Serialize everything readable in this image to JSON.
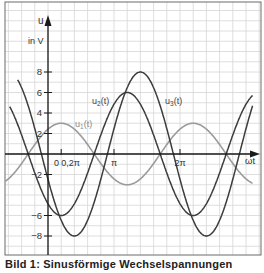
{
  "chart_data": {
    "type": "line",
    "title": "",
    "xlabel": "ωt",
    "ylabel": "u",
    "yunit": "in V",
    "xlim_rad_over_pi": [
      -0.65,
      3.1
    ],
    "ylim": [
      -9.5,
      14
    ],
    "y_ticks": [
      8,
      6,
      4,
      2,
      -2,
      -6,
      -8
    ],
    "y_tick_labels": [
      "8",
      "6",
      "4",
      "2",
      "−2",
      "−6",
      "−8"
    ],
    "x_ticks_over_pi": [
      0.2,
      1,
      2
    ],
    "x_tick_labels": [
      "0,2π",
      "π",
      "2π"
    ],
    "origin_label": "0",
    "grid": true,
    "series": [
      {
        "name": "u1(t)",
        "label_main": "u",
        "label_sub": "1",
        "label_tail": "(t)",
        "amplitude": 3,
        "phase_of_peak_over_pi": 0.2,
        "color": "#9a9a9a"
      },
      {
        "name": "u2(t)",
        "label_main": "u",
        "label_sub": "2",
        "label_tail": "(t)",
        "amplitude": 6,
        "phase_of_peak_over_pi": 1.2,
        "color": "#3c3c3c"
      },
      {
        "name": "u3(t)",
        "label_main": "u",
        "label_sub": "3",
        "label_tail": "(t)",
        "amplitude": 8,
        "phase_of_peak_over_pi": 1.4,
        "color": "#3c3c3c"
      }
    ]
  },
  "caption": "Bild 1: Sinusförmige Wechselspannungen"
}
